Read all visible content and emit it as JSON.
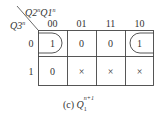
{
  "kmap": {
    "row_var": "Q3",
    "row_var_sup": "n",
    "col_vars": "Q2Q1",
    "col_var_a": "Q2",
    "col_var_b": "Q1",
    "col_var_sup": "n",
    "col_headers": [
      "00",
      "01",
      "11",
      "10"
    ],
    "row_headers": [
      "0",
      "1"
    ],
    "cells": [
      [
        "1",
        "0",
        "0",
        "1"
      ],
      [
        "0",
        "×",
        "×",
        "×"
      ]
    ],
    "caption_prefix": "(c)",
    "caption_var": "Q",
    "caption_sub": "1",
    "caption_sup": "n+1"
  }
}
